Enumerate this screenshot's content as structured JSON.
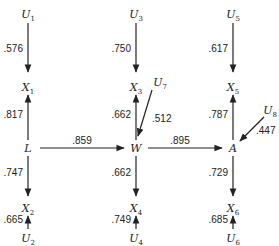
{
  "diagram": {
    "type": "path-diagram",
    "nodes": [
      {
        "id": "U1",
        "base": "U",
        "sub": "1"
      },
      {
        "id": "U2",
        "base": "U",
        "sub": "2"
      },
      {
        "id": "U3",
        "base": "U",
        "sub": "3"
      },
      {
        "id": "U4",
        "base": "U",
        "sub": "4"
      },
      {
        "id": "U5",
        "base": "U",
        "sub": "5"
      },
      {
        "id": "U6",
        "base": "U",
        "sub": "6"
      },
      {
        "id": "U7",
        "base": "U",
        "sub": "7"
      },
      {
        "id": "U8",
        "base": "U",
        "sub": "8"
      },
      {
        "id": "X1",
        "base": "X",
        "sub": "1"
      },
      {
        "id": "X2",
        "base": "X",
        "sub": "2"
      },
      {
        "id": "X3",
        "base": "X",
        "sub": "3"
      },
      {
        "id": "X4",
        "base": "X",
        "sub": "4"
      },
      {
        "id": "X5",
        "base": "X",
        "sub": "5"
      },
      {
        "id": "X6",
        "base": "X",
        "sub": "6"
      },
      {
        "id": "L",
        "base": "L",
        "sub": ""
      },
      {
        "id": "W",
        "base": "W",
        "sub": ""
      },
      {
        "id": "A",
        "base": "A",
        "sub": ""
      }
    ],
    "edges": [
      {
        "from": "U1",
        "to": "X1",
        "coef": ".576"
      },
      {
        "from": "L",
        "to": "X1",
        "coef": ".817"
      },
      {
        "from": "L",
        "to": "X2",
        "coef": ".747"
      },
      {
        "from": "U2",
        "to": "X2",
        "coef": ".665"
      },
      {
        "from": "U3",
        "to": "X3",
        "coef": ".750"
      },
      {
        "from": "W",
        "to": "X3",
        "coef": ".662"
      },
      {
        "from": "U7",
        "to": "W",
        "coef": ".512"
      },
      {
        "from": "W",
        "to": "X4",
        "coef": ".662"
      },
      {
        "from": "U4",
        "to": "X4",
        "coef": ".749"
      },
      {
        "from": "U5",
        "to": "X5",
        "coef": ".617"
      },
      {
        "from": "A",
        "to": "X5",
        "coef": ".787"
      },
      {
        "from": "U8",
        "to": "A",
        "coef": ".447"
      },
      {
        "from": "A",
        "to": "X6",
        "coef": ".729"
      },
      {
        "from": "U6",
        "to": "X6",
        "coef": ".685"
      },
      {
        "from": "L",
        "to": "W",
        "coef": ".859"
      },
      {
        "from": "W",
        "to": "A",
        "coef": ".895"
      }
    ]
  }
}
